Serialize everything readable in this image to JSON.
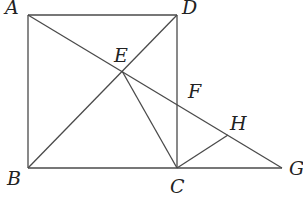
{
  "figure": {
    "type": "geometry-diagram",
    "points": {
      "A": {
        "label": "A",
        "x": 28,
        "y": 15
      },
      "D": {
        "label": "D",
        "x": 177,
        "y": 15
      },
      "B": {
        "label": "B",
        "x": 28,
        "y": 168
      },
      "C": {
        "label": "C",
        "x": 177,
        "y": 168
      },
      "G": {
        "label": "G",
        "x": 282,
        "y": 168
      },
      "E": {
        "label": "E",
        "x": 122,
        "y": 71
      },
      "F": {
        "label": "F",
        "x": 177,
        "y": 104
      },
      "H": {
        "label": "H",
        "x": 228,
        "y": 135
      }
    },
    "segments": [
      "AD",
      "DC",
      "CB",
      "BA",
      "AG",
      "BD",
      "EC",
      "CH",
      "CG"
    ],
    "stroke_color": "#4a4a4a"
  }
}
